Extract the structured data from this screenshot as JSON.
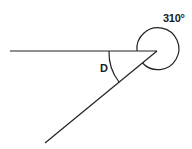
{
  "diagram": {
    "reflex_angle_label": "310°",
    "interior_angle_label": "D",
    "colors": {
      "stroke": "#222222",
      "background": "#ffffff",
      "text": "#1a1a1a"
    }
  }
}
